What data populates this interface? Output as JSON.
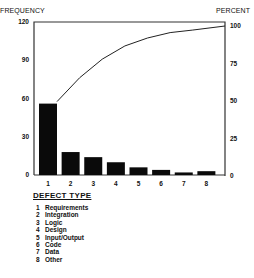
{
  "chart_data": {
    "type": "bar",
    "title": "",
    "xlabel": "DEFECT TYPE",
    "ylabel": "FREQUENCY",
    "y2label": "PERCENT",
    "categories": [
      "1",
      "2",
      "3",
      "4",
      "5",
      "6",
      "7",
      "8"
    ],
    "series": [
      {
        "name": "Frequency",
        "type": "bar",
        "axis": "left",
        "values": [
          56,
          18,
          14,
          10,
          6,
          4,
          2,
          3
        ]
      },
      {
        "name": "Cumulative Percent",
        "type": "line",
        "axis": "right",
        "values": [
          49.6,
          65.5,
          77.9,
          86.7,
          92.0,
          95.6,
          97.3,
          100
        ]
      }
    ],
    "ylim": [
      0,
      120
    ],
    "y2lim": [
      0,
      100
    ],
    "yticks": [
      0,
      30,
      60,
      90,
      120
    ],
    "y2ticks": [
      0,
      25,
      50,
      75,
      100
    ],
    "grid": false,
    "legend": {
      "title": "DEFECT TYPE",
      "position": "below",
      "entries": [
        {
          "num": "1",
          "label": "Requirements"
        },
        {
          "num": "2",
          "label": "Integration"
        },
        {
          "num": "3",
          "label": "Logic"
        },
        {
          "num": "4",
          "label": "Design"
        },
        {
          "num": "5",
          "label": "Input/Output"
        },
        {
          "num": "6",
          "label": "Code"
        },
        {
          "num": "7",
          "label": "Data"
        },
        {
          "num": "8",
          "label": "Other"
        }
      ]
    }
  },
  "labels": {
    "left_axis_title": "FREQUENCY",
    "right_axis_title": "PERCENT"
  }
}
